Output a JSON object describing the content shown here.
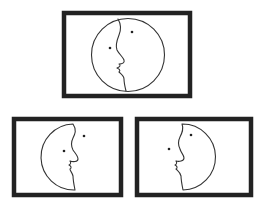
{
  "figure": {
    "panels": [
      {
        "id": "top",
        "label": "combined",
        "content": "full circle with central profile line and two eye dots"
      },
      {
        "id": "bottom-left",
        "label": "left-half",
        "content": "left half-circle face looking right"
      },
      {
        "id": "bottom-right",
        "label": "right-half",
        "content": "right half-circle face looking left"
      }
    ],
    "colors": {
      "frame": "#222222",
      "line": "#333333",
      "background": "#ffffff"
    }
  }
}
